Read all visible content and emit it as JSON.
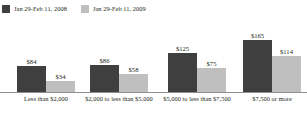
{
  "legend": {
    "entries": [
      {
        "label": "Jan 29-Feb 11, 2008",
        "color": "#3f3f3f",
        "swatch_name": "legend-swatch-2008"
      },
      {
        "label": "Jan 29-Feb 11, 2009",
        "color": "#bfbfbf",
        "swatch_name": "legend-swatch-2009"
      }
    ]
  },
  "axis": {
    "baseline_color": "#8e8e8e"
  },
  "chart_data": {
    "type": "bar",
    "title": "",
    "subtitle": "",
    "xlabel": "",
    "ylabel": "",
    "grid": false,
    "legend_position": "top-left",
    "ylim": [
      0,
      180
    ],
    "categories": [
      "Less than $2,000",
      "$2,000 to less than $5,000",
      "$5,000 to less than $7,500",
      "$7,500 or more"
    ],
    "series": [
      {
        "name": "Jan 29-Feb 11, 2008",
        "color": "#3f3f3f",
        "values": [
          84,
          86,
          125,
          165
        ],
        "labels": [
          "$84",
          "$86",
          "$125",
          "$165"
        ]
      },
      {
        "name": "Jan 29-Feb 11, 2009",
        "color": "#bfbfbf",
        "values": [
          34,
          58,
          75,
          114
        ],
        "labels": [
          "$34",
          "$58",
          "$75",
          "$114"
        ]
      }
    ]
  }
}
